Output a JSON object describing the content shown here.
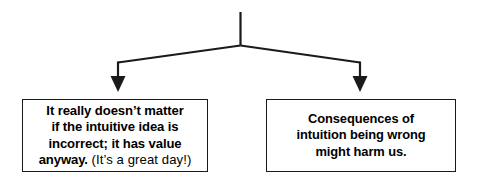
{
  "diagram": {
    "type": "branching-flow-chart",
    "orientation": "top-down",
    "line_color": "#1a1a1a",
    "box_border_color": "#1a1a1a",
    "box_fill_color": "#ffffff",
    "background_color": "#ffffff",
    "text_color": "#000000",
    "connector": {
      "name": "split-connector",
      "stem_label": "",
      "branch_count": 2,
      "arrowhead_style": "solid-triangle-down"
    },
    "nodes": [
      {
        "id": "left",
        "name": "value-anyway-node",
        "lines": [
          "It really doesn’t matter",
          "if the intuitive idea is",
          "incorrect; it has value",
          "anyway."
        ],
        "aside": "(It’s a great day!)",
        "full_text": "It really doesn’t matter if the intuitive idea is incorrect; it has value anyway. (It’s a great day!)"
      },
      {
        "id": "right",
        "name": "harm-consequences-node",
        "lines": [
          "Consequences of",
          "intuition being wrong",
          "might harm us."
        ],
        "aside": "",
        "full_text": "Consequences of intuition being wrong might harm us."
      }
    ]
  }
}
